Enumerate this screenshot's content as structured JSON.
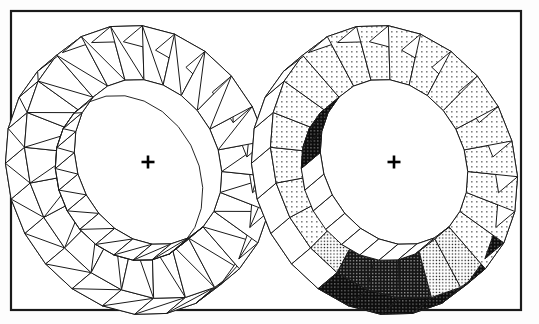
{
  "figure": {
    "name": "faceted-annular-ring-pair",
    "caption": "",
    "background_color": "#fdfdfd",
    "frame": {
      "name": "figure-frame",
      "x": 11,
      "y": 11,
      "width": 510,
      "height": 299,
      "stroke_color": "#1a1a1a",
      "fill_color": "#ffffff",
      "stroke_width": 2.2
    },
    "panels": [
      {
        "id": "panel-left",
        "label": "wireframe-annulus",
        "render_mode": "wireframe",
        "center": {
          "x": 148,
          "y": 162
        },
        "center_marker": "plus",
        "center_marker_size": 13,
        "outer_radius_x": 118,
        "outer_radius_y": 142,
        "inner_radius_x": 70,
        "inner_radius_y": 86,
        "tilt_degrees": -28,
        "thickness_offset": {
          "x": -19,
          "y": 16
        },
        "facet_count": 24,
        "stroke_color": "#1a1a1a",
        "stroke_width": 1.0,
        "fill_color": "#ffffff",
        "show_diagonals": true
      },
      {
        "id": "panel-right",
        "label": "shaded-annulus",
        "render_mode": "stipple-shaded",
        "center": {
          "x": 394,
          "y": 162
        },
        "center_marker": "plus",
        "center_marker_size": 13,
        "outer_radius_x": 118,
        "outer_radius_y": 142,
        "inner_radius_x": 70,
        "inner_radius_y": 86,
        "tilt_degrees": -28,
        "thickness_offset": {
          "x": -19,
          "y": 16
        },
        "facet_count": 24,
        "stroke_color": "#1a1a1a",
        "stroke_width": 1.0,
        "show_diagonals": false
      }
    ],
    "shading_levels": [
      {
        "name": "level-0-white",
        "id": "white",
        "color": "#ffffff",
        "dot_density": 0,
        "dot_color": "#000000"
      },
      {
        "name": "level-1-light",
        "id": "light",
        "color": "#ffffff",
        "dot_density": 1,
        "dot_color": "#000000"
      },
      {
        "name": "level-2-medium",
        "id": "medium",
        "color": "#ffffff",
        "dot_density": 2,
        "dot_color": "#000000"
      },
      {
        "name": "level-3-dark",
        "id": "dark",
        "color": "#2a2a2a",
        "dot_density": 3,
        "dot_color": "#ffffff"
      },
      {
        "name": "level-4-black",
        "id": "black",
        "color": "#111111",
        "dot_density": 4,
        "dot_color": "#ffffff"
      }
    ],
    "face_shading": {
      "top_face_levels": [
        "light",
        "light",
        "light",
        "light",
        "light",
        "light",
        "light",
        "light",
        "light",
        "light",
        "light",
        "medium",
        "medium",
        "dark",
        "dark",
        "dark",
        "medium",
        "light",
        "light",
        "light",
        "light",
        "light",
        "light",
        "light"
      ],
      "outer_wall_levels": [
        "white",
        "white",
        "white",
        "white",
        "white",
        "white",
        "white",
        "white",
        "white",
        "black",
        "black",
        "black",
        "black",
        "black",
        "black",
        "black",
        "white",
        "white",
        "white",
        "white",
        "white",
        "white",
        "white",
        "white"
      ],
      "inner_wall_levels": [
        "black",
        "black",
        "black",
        "black",
        "medium",
        "medium",
        "white",
        "white",
        "white",
        "white",
        "white",
        "white",
        "white",
        "white",
        "white",
        "white",
        "white",
        "white",
        "white",
        "white",
        "black",
        "black",
        "black",
        "black"
      ]
    }
  }
}
